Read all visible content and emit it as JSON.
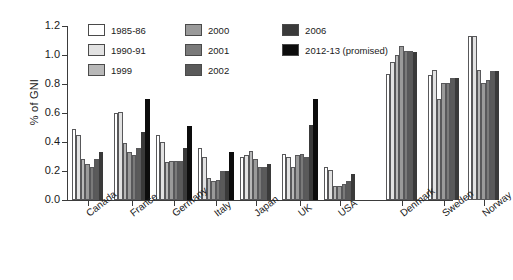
{
  "chart_data": {
    "type": "bar",
    "title": "",
    "xlabel": "",
    "ylabel": "% of GNI",
    "ylim": [
      0.0,
      1.2
    ],
    "yticks": [
      "0.0",
      "0.2",
      "0.4",
      "0.6",
      "0.8",
      "1.0",
      "1.2"
    ],
    "ytick_values": [
      0.0,
      0.2,
      0.4,
      0.6,
      0.8,
      1.0,
      1.2
    ],
    "grid": false,
    "legend_position": "top-center",
    "categories": [
      "Canada",
      "France",
      "Germany",
      "Italy",
      "Japan",
      "UK",
      "USA",
      "Denmark",
      "Sweden",
      "Norway"
    ],
    "series": [
      {
        "name": "1985-86",
        "color": "#ffffff",
        "values": [
          0.49,
          0.6,
          0.45,
          0.36,
          0.3,
          0.32,
          0.23,
          0.87,
          0.86,
          1.13
        ]
      },
      {
        "name": "1990-91",
        "color": "#e2e2e2",
        "values": [
          0.45,
          0.61,
          0.4,
          0.3,
          0.31,
          0.3,
          0.21,
          0.95,
          0.9,
          1.13
        ]
      },
      {
        "name": "1999",
        "color": "#b8b8b8",
        "values": [
          0.28,
          0.39,
          0.26,
          0.15,
          0.34,
          0.23,
          0.1,
          1.0,
          0.7,
          0.9
        ]
      },
      {
        "name": "2000",
        "color": "#9a9a9a",
        "values": [
          0.25,
          0.33,
          0.27,
          0.13,
          0.28,
          0.31,
          0.1,
          1.06,
          0.81,
          0.81
        ]
      },
      {
        "name": "2001",
        "color": "#7a7a7a",
        "values": [
          0.23,
          0.31,
          0.27,
          0.14,
          0.23,
          0.32,
          0.11,
          1.03,
          0.81,
          0.83
        ]
      },
      {
        "name": "2002",
        "color": "#5a5a5a",
        "values": [
          0.28,
          0.36,
          0.27,
          0.2,
          0.23,
          0.3,
          0.13,
          1.03,
          0.84,
          0.89
        ]
      },
      {
        "name": "2006",
        "color": "#3a3a3a",
        "values": [
          0.33,
          0.47,
          0.36,
          0.2,
          0.25,
          0.52,
          0.18,
          1.02,
          0.84,
          0.89
        ]
      },
      {
        "name": "2012-13 (promised)",
        "color": "#0d0d0d",
        "values": [
          0.0,
          0.7,
          0.51,
          0.33,
          0.0,
          0.7,
          0.0,
          0.0,
          0.0,
          0.0
        ]
      }
    ]
  },
  "legend": {
    "items": [
      {
        "label": "1985-86",
        "color": "#ffffff"
      },
      {
        "label": "1990-91",
        "color": "#e2e2e2"
      },
      {
        "label": "1999",
        "color": "#b8b8b8"
      },
      {
        "label": "2000",
        "color": "#9a9a9a"
      },
      {
        "label": "2001",
        "color": "#7a7a7a"
      },
      {
        "label": "2002",
        "color": "#5a5a5a"
      },
      {
        "label": "2006",
        "color": "#3a3a3a"
      },
      {
        "label": "2012-13 (promised)",
        "color": "#0d0d0d"
      }
    ]
  }
}
